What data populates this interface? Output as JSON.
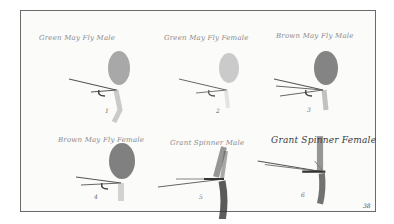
{
  "plate": {
    "page_number": "38",
    "flies": [
      {
        "label": "Green May Fly Male",
        "number": "1",
        "wing_color": "#8c8c8c",
        "wing_opacity": 0.75
      },
      {
        "label": "Green May Fly Female",
        "number": "2",
        "wing_color": "#b5b5b5",
        "wing_opacity": 0.7
      },
      {
        "label": "Brown May Fly Male",
        "number": "3",
        "wing_color": "#6e6e6e",
        "wing_opacity": 0.85
      },
      {
        "label": "Brown May Fly Female",
        "number": "4",
        "wing_color": "#6a6a6a",
        "wing_opacity": 0.85
      },
      {
        "label": "Grant Spinner Male",
        "number": "5",
        "wing_color": "#444444",
        "wing_opacity": 0.9
      },
      {
        "label": "Grant Spinner Female",
        "number": "6",
        "wing_color": "#505050",
        "wing_opacity": 0.9
      }
    ]
  }
}
